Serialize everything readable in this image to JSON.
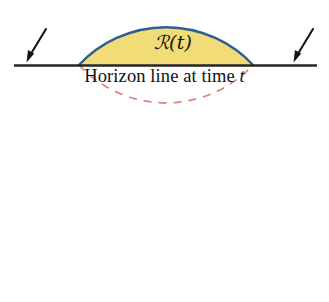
{
  "figure": {
    "title_text": "",
    "region_label": "ℛ(t)",
    "horizon_caption_text": "Horizon line at time",
    "horizon_caption_variable": "t",
    "arrows": [
      {
        "name": "left-incoming-arrow",
        "direction": "down-left"
      },
      {
        "name": "right-incoming-arrow",
        "direction": "down-left"
      }
    ],
    "colors": {
      "region_fill": "#f2dc78",
      "arc_stroke": "#2e5f8f",
      "circle_dashed_stroke": "#d9847a",
      "horizon_line": "#262626",
      "arrow": "#141414",
      "text": "#111111",
      "background": "#ffffff"
    },
    "geometry": {
      "circle_center_x": 166,
      "circle_center_y": 166,
      "circle_radius": 119,
      "horizon_y": 65,
      "horizon_x_start": 14,
      "horizon_x_end": 317,
      "arc_left_intersection_x": 79,
      "arc_right_intersection_x": 254,
      "arc_apex_y": 23
    }
  }
}
